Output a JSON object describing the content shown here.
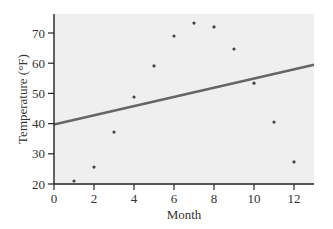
{
  "chart_data": {
    "type": "scatter",
    "title": "",
    "xlabel": "Month",
    "ylabel": "Temperature (°F)",
    "xlim": [
      0,
      13
    ],
    "ylim": [
      20,
      76
    ],
    "grid": false,
    "legend": null,
    "x_ticks": [
      0,
      2,
      4,
      6,
      8,
      10,
      12
    ],
    "y_ticks": [
      20,
      30,
      40,
      50,
      60,
      70
    ],
    "series": [
      {
        "name": "Monthly temperature",
        "type": "scatter",
        "x": [
          1,
          2,
          3,
          4,
          5,
          6,
          7,
          8,
          9,
          10,
          11,
          12
        ],
        "y": [
          21,
          25.6,
          37.2,
          48.8,
          59.1,
          69,
          73.3,
          72,
          64.7,
          53.4,
          40.5,
          27.3
        ]
      },
      {
        "name": "Linear fit",
        "type": "line",
        "x": [
          0,
          13
        ],
        "y": [
          39.7,
          59.5
        ]
      }
    ],
    "colors": {
      "plot_background": "#efefef",
      "points": "#444444",
      "fit_line": "#666666",
      "axis": "#222222"
    }
  }
}
